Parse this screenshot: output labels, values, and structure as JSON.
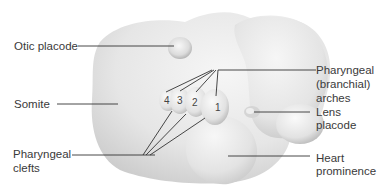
{
  "diagram": {
    "labels": {
      "otic_placode": "Otic placode",
      "somite": "Somite",
      "pharyngeal_clefts_1": "Pharyngeal",
      "pharyngeal_clefts_2": "clefts",
      "pharyngeal_arches_1": "Pharyngeal",
      "pharyngeal_arches_2": "(branchial)",
      "pharyngeal_arches_3": "arches",
      "lens_placode_1": "Lens",
      "lens_placode_2": "placode",
      "heart_prominence_1": "Heart",
      "heart_prominence_2": "prominence"
    },
    "arch_numbers": [
      "4",
      "3",
      "2",
      "1"
    ],
    "colors": {
      "background": "#ffffff",
      "embryo_fill": "#e9e9e9",
      "embryo_shade": "#c8c8c8",
      "leader_line": "#333333",
      "text": "#3a3a3a"
    }
  }
}
